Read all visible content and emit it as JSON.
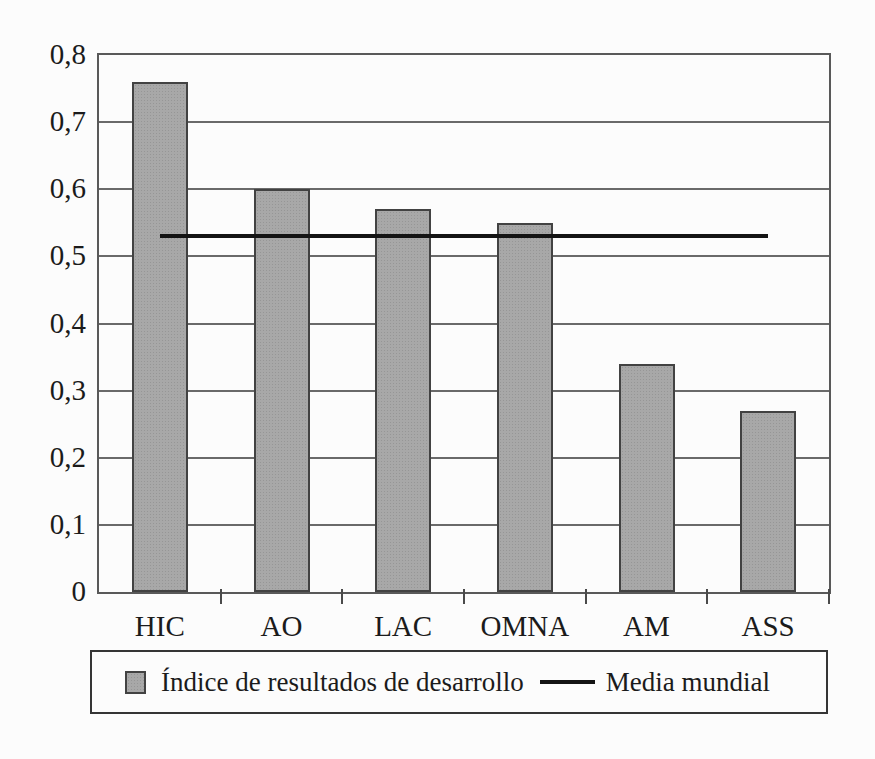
{
  "page": {
    "background": "#fcfcfc"
  },
  "chart_data": {
    "type": "bar",
    "title": "",
    "xlabel": "",
    "ylabel": "",
    "categories": [
      "HIC",
      "AO",
      "LAC",
      "OMNA",
      "AM",
      "ASS"
    ],
    "series": [
      {
        "name": "Índice de resultados de desarrollo",
        "type": "bar",
        "values": [
          0.76,
          0.6,
          0.57,
          0.55,
          0.34,
          0.27
        ]
      },
      {
        "name": "Media mundial",
        "type": "line",
        "values": [
          0.53,
          0.53,
          0.53,
          0.53,
          0.53,
          0.53
        ]
      }
    ],
    "ylim": [
      0,
      0.8
    ],
    "ytick_step": 0.1,
    "yticklabels": [
      "0",
      "0,1",
      "0,2",
      "0,3",
      "0,4",
      "0,5",
      "0,6",
      "0,7",
      "0,8"
    ],
    "decimal_separator": ",",
    "grid": true,
    "legend_position": "bottom"
  },
  "legend": {
    "items": [
      {
        "swatch": "bar-swatch",
        "label": "Índice de resultados de desarrollo"
      },
      {
        "swatch": "line-swatch",
        "label": "Media mundial"
      }
    ]
  },
  "colors": {
    "bar_fill": "#a8a8a8",
    "bar_dot": "#969696",
    "bar_border": "#424242",
    "grid_line": "#6a6a6a",
    "frame": "#595959",
    "media_line": "#141414",
    "tick": "#4a4a4a",
    "text": "#1b1b1b",
    "background": "#fcfcfc",
    "legend_border": "#353535"
  }
}
